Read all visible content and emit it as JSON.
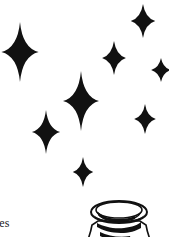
{
  "page": {
    "width": 169,
    "height": 237,
    "background_color": "#ffffff",
    "ink_color": "#111111",
    "kind": "illustration-fragment"
  },
  "caption": {
    "text": "les",
    "note": "word fragment cropped at left page edge"
  },
  "illustration": {
    "name": "jar",
    "label": "jar",
    "description": "line-art jar with wide elliptical rim, cropped at bottom edge"
  },
  "stars": [
    {
      "id": "star-top-right",
      "label": "star",
      "cx": 143,
      "cy": 21,
      "size": 17,
      "v_ratio": 1.0,
      "h_ratio": 0.72,
      "waist": 0.2
    },
    {
      "id": "star-left-large",
      "label": "star",
      "cx": 20,
      "cy": 52,
      "size": 30,
      "v_ratio": 1.0,
      "h_ratio": 0.62,
      "waist": 0.15
    },
    {
      "id": "star-upper-middle",
      "label": "star",
      "cx": 114,
      "cy": 58,
      "size": 17,
      "v_ratio": 1.0,
      "h_ratio": 0.7,
      "waist": 0.2
    },
    {
      "id": "star-far-right",
      "label": "star",
      "cx": 161,
      "cy": 70,
      "size": 12,
      "v_ratio": 1.0,
      "h_ratio": 0.82,
      "waist": 0.22
    },
    {
      "id": "star-center-large",
      "label": "star",
      "cx": 81,
      "cy": 101,
      "size": 30,
      "v_ratio": 1.0,
      "h_ratio": 0.6,
      "waist": 0.15
    },
    {
      "id": "star-right-lower",
      "label": "star",
      "cx": 145,
      "cy": 119,
      "size": 15,
      "v_ratio": 1.0,
      "h_ratio": 0.72,
      "waist": 0.2
    },
    {
      "id": "star-left-lower",
      "label": "star",
      "cx": 46,
      "cy": 132,
      "size": 22,
      "v_ratio": 1.0,
      "h_ratio": 0.64,
      "waist": 0.17
    },
    {
      "id": "star-bottom",
      "label": "star",
      "cx": 83,
      "cy": 172,
      "size": 15,
      "v_ratio": 1.0,
      "h_ratio": 0.68,
      "waist": 0.2
    }
  ]
}
